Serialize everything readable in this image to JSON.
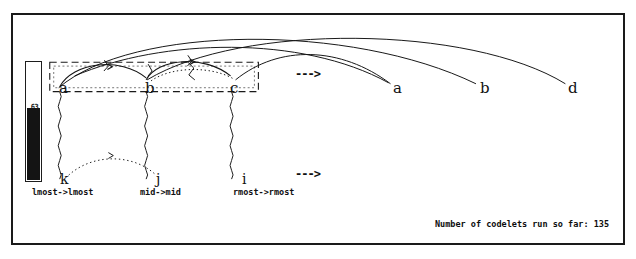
{
  "window": {
    "title": "Copycat Workspace"
  },
  "temperature": {
    "label": "temperature-thermometer",
    "value": "63",
    "fill_percent": 60
  },
  "initial_string": {
    "name": "initial-string",
    "letters": [
      {
        "char": "a",
        "x": 57,
        "y": 82
      },
      {
        "char": "b",
        "x": 143,
        "y": 82
      },
      {
        "char": "c",
        "x": 228,
        "y": 82
      }
    ]
  },
  "target_string": {
    "name": "target-string",
    "letters": [
      {
        "char": "a",
        "x": 391,
        "y": 82
      },
      {
        "char": "b",
        "x": 478,
        "y": 82
      },
      {
        "char": "d",
        "x": 566,
        "y": 82
      }
    ]
  },
  "description_letters": [
    {
      "char": "k",
      "x": 57,
      "y": 177
    },
    {
      "char": "j",
      "x": 154,
      "y": 177
    },
    {
      "char": "i",
      "x": 240,
      "y": 177
    }
  ],
  "descriptions": [
    {
      "text": "lmost->lmost",
      "x": 30,
      "y": 185
    },
    {
      "text": "mid->mid",
      "x": 138,
      "y": 185
    },
    {
      "text": "rmost->rmost",
      "x": 231,
      "y": 185
    }
  ],
  "rules": [
    {
      "text": "--->",
      "x": 293,
      "y": 66,
      "name": "rule-arrow-top"
    },
    {
      "text": "--->",
      "x": 293,
      "y": 166,
      "name": "rule-arrow-bottom"
    }
  ],
  "group": {
    "name": "whole-string-group",
    "x": 48,
    "y": 61,
    "width": 210,
    "height": 30
  },
  "status": {
    "codelets_label": "Number of codelets run so far: 135"
  },
  "colors": {
    "ink": "#111111",
    "frame": "#1a1a1a",
    "background": "#ffffff",
    "thermometer_fill": "#141414"
  }
}
